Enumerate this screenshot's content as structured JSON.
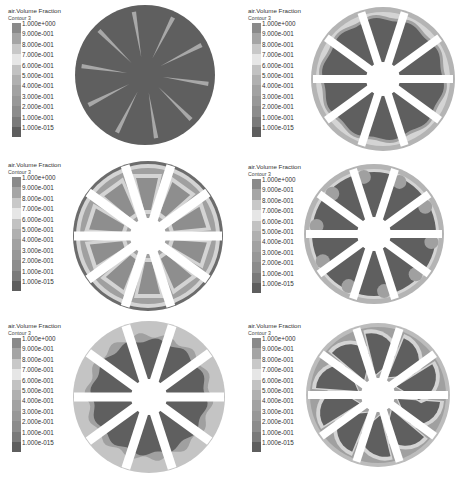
{
  "figure": {
    "panels": [
      {
        "id": 1,
        "legend": {
          "title": "air.Volume Fraction",
          "subtitle": "Contour 3"
        },
        "state": "initial - thin blades, liquid filled"
      },
      {
        "id": 2,
        "legend": {
          "title": "air.Volume Fraction",
          "subtitle": "Contour 3"
        },
        "state": "air at rim"
      },
      {
        "id": 3,
        "legend": {
          "title": "air.Volume Fraction",
          "subtitle": "Contour 3"
        },
        "state": "air pockets along blades"
      },
      {
        "id": 4,
        "legend": {
          "title": "air.Volume Fraction",
          "subtitle": "Contour 3"
        },
        "state": "air bubbles at rim"
      },
      {
        "id": 5,
        "legend": {
          "title": "air.Volume Fraction",
          "subtitle": "Contour 3"
        },
        "state": "thick air annulus"
      },
      {
        "id": 6,
        "legend": {
          "title": "air.Volume Fraction",
          "subtitle": "Contour 3"
        },
        "state": "crescent air regions"
      }
    ],
    "colorbar": {
      "ticks": [
        "1.000e+000",
        "9.000e-001",
        "8.000e-001",
        "7.000e-001",
        "6.000e-001",
        "5.000e-001",
        "4.000e-001",
        "3.000e-001",
        "2.000e-001",
        "1.000e-001",
        "1.000e-015"
      ],
      "bands": [
        "#8a8a8a",
        "#a5a5a5",
        "#c8c8c8",
        "#e6e6e6",
        "#c2c2c2",
        "#b0b0b0",
        "#a2a2a2",
        "#989898",
        "#8c8c8c",
        "#7a7a7a",
        "#5e5e5e"
      ]
    },
    "colors": {
      "liquid": "#5f5f5f",
      "blade": "#ffffff",
      "rim_air": "#b4b4b4",
      "mid_air": "#a0a0a0",
      "light_air": "#d4d4d4",
      "thin_blade": "#a8a8a8",
      "ring_dark": "#6c6c6c"
    }
  }
}
